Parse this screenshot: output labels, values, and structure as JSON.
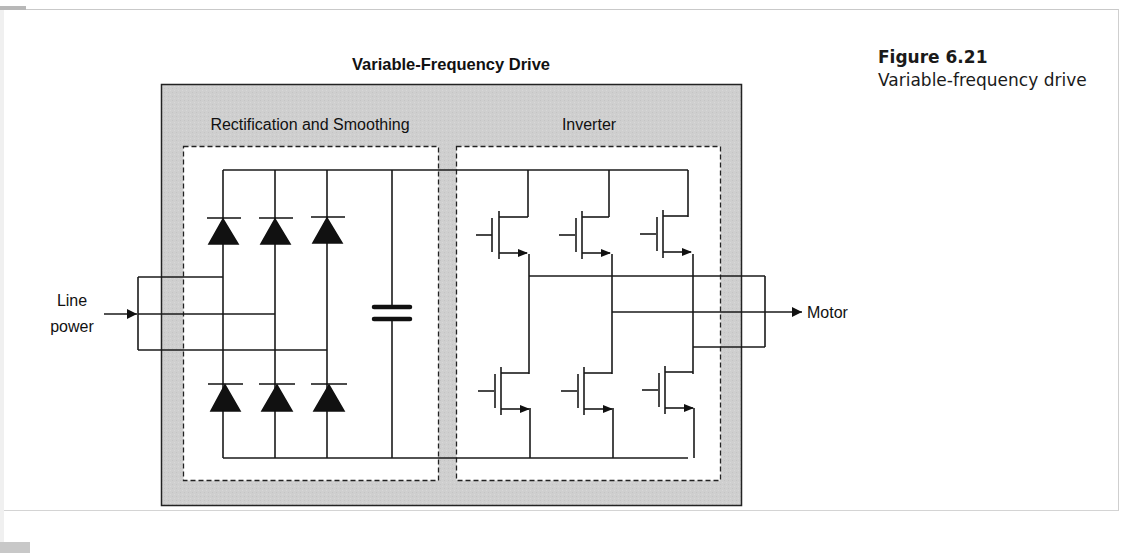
{
  "figure": {
    "number_label": "Figure 6.21",
    "caption": "Variable-frequency drive"
  },
  "diagram": {
    "title": "Variable-Frequency Drive",
    "sections": [
      {
        "name": "rectification",
        "label": "Rectification and Smoothing",
        "components": [
          "diode",
          "diode",
          "diode",
          "diode",
          "diode",
          "diode",
          "capacitor"
        ]
      },
      {
        "name": "inverter",
        "label": "Inverter",
        "components": [
          "transistor",
          "transistor",
          "transistor",
          "transistor",
          "transistor",
          "transistor"
        ]
      }
    ],
    "input_label_line1": "Line",
    "input_label_line2": "power",
    "output_label": "Motor",
    "colors": {
      "outer_box_fill": "#cfcfcf",
      "inner_box_fill": "#ffffff",
      "stroke": "#1a1a1a"
    }
  }
}
